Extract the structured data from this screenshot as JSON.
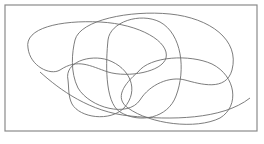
{
  "diagram": {
    "type": "overlapping-closed-curves",
    "frame": {
      "x": 5,
      "y": 5,
      "width": 252,
      "height": 126,
      "stroke": "#8a8a8a"
    },
    "curve_stroke": "#6e6e6e",
    "curves": [
      {
        "name": "curve-large-left",
        "d": "M 28 48 C 24 28, 60 20, 100 22 C 140 24, 170 42, 166 58 C 162 72, 128 78, 108 72 C 90 66, 78 58, 60 70 C 50 76, 30 66, 28 48 Z"
      },
      {
        "name": "curve-large-right",
        "d": "M 75 40 C 80 20, 130 10, 170 14 C 210 18, 240 40, 232 70 C 226 92, 200 84, 185 80 C 170 76, 150 84, 140 100 C 128 118, 90 108, 78 88 C 70 72, 72 52, 75 40 Z"
      },
      {
        "name": "curve-tall-middle",
        "d": "M 108 40 C 110 22, 140 12, 160 22 C 182 34, 186 70, 176 96 C 168 118, 140 124, 120 112 C 104 102, 106 60, 108 40 Z"
      },
      {
        "name": "curve-lower-left",
        "d": "M 68 80 C 64 62, 90 54, 108 60 C 130 68, 140 90, 124 108 C 110 122, 80 118, 72 104 C 68 96, 69 88, 68 80 Z"
      },
      {
        "name": "curve-lower-right",
        "d": "M 138 72 C 150 56, 190 54, 212 64 C 236 76, 240 106, 220 118 C 196 130, 150 124, 128 108 C 114 98, 124 84, 138 72 Z"
      },
      {
        "name": "curve-bottom-sweep",
        "d": "M 40 72 C 60 90, 90 112, 130 116 C 170 120, 222 120, 250 98"
      }
    ]
  }
}
